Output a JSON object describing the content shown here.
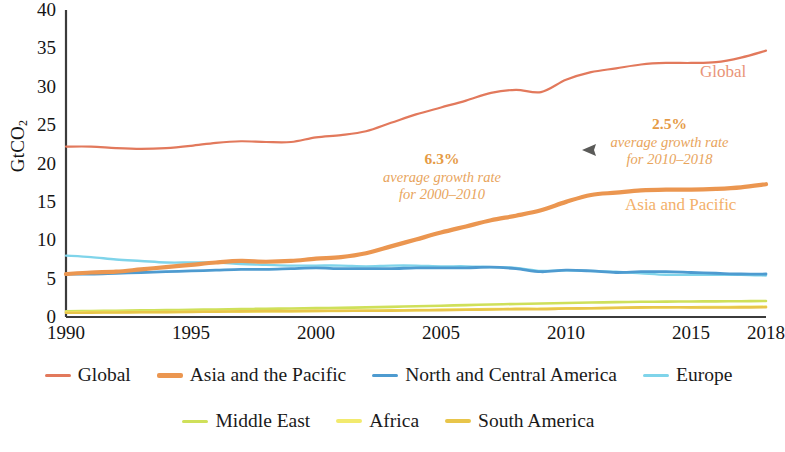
{
  "chart_data": {
    "type": "line",
    "title": "",
    "xlabel": "",
    "ylabel": "GtCO2",
    "ylabel_display": "GtCO",
    "ylabel_sub": "2",
    "xlim": [
      1990,
      2018
    ],
    "ylim": [
      0,
      40
    ],
    "yticks": [
      0,
      5,
      10,
      15,
      20,
      25,
      30,
      35,
      40
    ],
    "xticks": [
      1990,
      1995,
      2000,
      2005,
      2010,
      2015,
      2018
    ],
    "grid": false,
    "legend_position": "bottom",
    "x": [
      1990,
      1991,
      1992,
      1993,
      1994,
      1995,
      1996,
      1997,
      1998,
      1999,
      2000,
      2001,
      2002,
      2003,
      2004,
      2005,
      2006,
      2007,
      2008,
      2009,
      2010,
      2011,
      2012,
      2013,
      2014,
      2015,
      2016,
      2017,
      2018
    ],
    "series": [
      {
        "name": "Global",
        "color": "#e2795c",
        "width": 2.2,
        "values": [
          22.2,
          22.2,
          22.0,
          21.9,
          22.0,
          22.3,
          22.7,
          22.9,
          22.8,
          22.8,
          23.4,
          23.7,
          24.2,
          25.3,
          26.4,
          27.3,
          28.2,
          29.2,
          29.6,
          29.3,
          30.9,
          31.9,
          32.4,
          32.9,
          33.1,
          33.1,
          33.2,
          33.8,
          34.7
        ]
      },
      {
        "name": "Asia and the Pacific",
        "color": "#eb9650",
        "width": 4.2,
        "values": [
          5.6,
          5.8,
          5.9,
          6.2,
          6.5,
          6.8,
          7.1,
          7.3,
          7.2,
          7.3,
          7.6,
          7.8,
          8.3,
          9.2,
          10.1,
          11.0,
          11.8,
          12.6,
          13.2,
          13.9,
          15.0,
          15.9,
          16.2,
          16.5,
          16.6,
          16.6,
          16.7,
          16.9,
          17.3
        ]
      },
      {
        "name": "North and Central America",
        "color": "#4e9bd0",
        "width": 2.8,
        "values": [
          5.6,
          5.6,
          5.7,
          5.8,
          5.9,
          6.0,
          6.1,
          6.2,
          6.2,
          6.3,
          6.4,
          6.3,
          6.3,
          6.3,
          6.4,
          6.4,
          6.4,
          6.5,
          6.3,
          5.9,
          6.1,
          6.0,
          5.8,
          5.9,
          5.9,
          5.8,
          5.7,
          5.6,
          5.6
        ]
      },
      {
        "name": "Europe",
        "color": "#7fd4ea",
        "width": 2.4,
        "values": [
          8.0,
          7.8,
          7.5,
          7.3,
          7.1,
          7.1,
          7.1,
          6.9,
          6.8,
          6.7,
          6.7,
          6.7,
          6.6,
          6.7,
          6.7,
          6.6,
          6.6,
          6.5,
          6.4,
          6.0,
          6.1,
          6.0,
          5.9,
          5.7,
          5.5,
          5.5,
          5.5,
          5.5,
          5.4
        ]
      },
      {
        "name": "Middle East",
        "color": "#cfe05a",
        "width": 2.6,
        "values": [
          0.75,
          0.78,
          0.82,
          0.86,
          0.9,
          0.94,
          0.98,
          1.02,
          1.08,
          1.1,
          1.15,
          1.2,
          1.25,
          1.32,
          1.4,
          1.47,
          1.55,
          1.63,
          1.7,
          1.75,
          1.82,
          1.88,
          1.94,
          1.98,
          2.0,
          2.02,
          2.04,
          2.06,
          2.08
        ]
      },
      {
        "name": "Africa",
        "color": "#f2ea6e",
        "width": 2.6,
        "values": [
          0.62,
          0.63,
          0.64,
          0.65,
          0.66,
          0.68,
          0.7,
          0.72,
          0.74,
          0.75,
          0.78,
          0.8,
          0.83,
          0.86,
          0.9,
          0.94,
          0.98,
          1.02,
          1.06,
          1.08,
          1.12,
          1.14,
          1.18,
          1.22,
          1.26,
          1.28,
          1.3,
          1.32,
          1.35
        ]
      },
      {
        "name": "South America",
        "color": "#e8c54a",
        "width": 2.6,
        "values": [
          0.55,
          0.57,
          0.59,
          0.61,
          0.64,
          0.67,
          0.7,
          0.73,
          0.76,
          0.77,
          0.8,
          0.81,
          0.82,
          0.83,
          0.87,
          0.9,
          0.94,
          0.98,
          1.03,
          1.02,
          1.1,
          1.14,
          1.2,
          1.25,
          1.28,
          1.25,
          1.24,
          1.25,
          1.28
        ]
      }
    ],
    "annotations": [
      {
        "id": "growth-2000-2010",
        "pct": "6.3%",
        "line1": "average growth rate",
        "line2": "for 2000–2010",
        "color": "#e8a45c"
      },
      {
        "id": "growth-2010-2018",
        "pct": "2.5%",
        "line1": "average growth rate",
        "line2": "for 2010–2018",
        "color": "#e8a45c"
      }
    ],
    "inline_labels": [
      {
        "id": "global-inline",
        "text": "Global",
        "color": "#e99478"
      },
      {
        "id": "asia-inline",
        "text": "Asia and Pacific",
        "color": "#f3b06a"
      }
    ]
  },
  "legend": {
    "row1": [
      {
        "label": "Global",
        "color": "#e2795c",
        "thickness": 3
      },
      {
        "label": "Asia and the Pacific",
        "color": "#eb9650",
        "thickness": 5
      },
      {
        "label": "North and Central America",
        "color": "#4e9bd0",
        "thickness": 3
      },
      {
        "label": "Europe",
        "color": "#7fd4ea",
        "thickness": 3
      }
    ],
    "row2": [
      {
        "label": "Middle East",
        "color": "#cfe05a",
        "thickness": 3
      },
      {
        "label": "Africa",
        "color": "#f2ea6e",
        "thickness": 4
      },
      {
        "label": "South America",
        "color": "#e8c54a",
        "thickness": 4
      }
    ]
  }
}
